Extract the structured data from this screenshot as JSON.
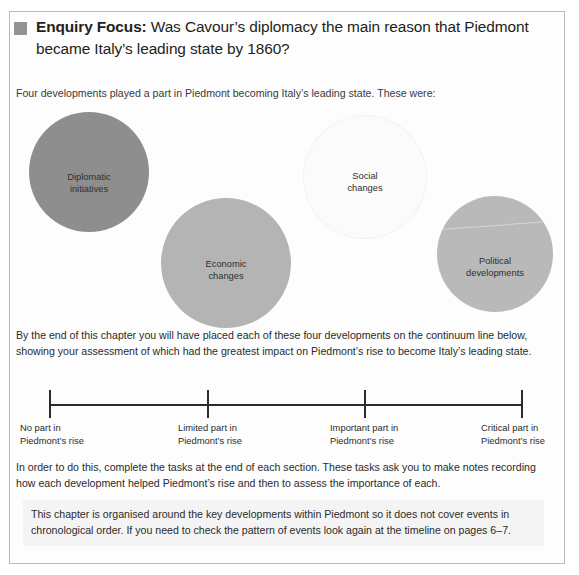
{
  "enquiry": {
    "bullet_icon": "square-bullet-icon",
    "label": "Enquiry Focus:",
    "question": " Was Cavour’s diplomacy the main reason that Piedmont became Italy’s leading state by 1860?"
  },
  "intro": "Four developments played a part in Piedmont becoming Italy’s leading state. These were:",
  "developments": [
    {
      "id": "diplomatic",
      "line1": "Diplomatic",
      "line2": "initiatives",
      "color": "#8e8e8e"
    },
    {
      "id": "economic",
      "line1": "Economic",
      "line2": "changes",
      "color": "#b4b4b4"
    },
    {
      "id": "social",
      "line1": "Social",
      "line2": "changes",
      "color": "#fbfbfb"
    },
    {
      "id": "political",
      "line1": "Political",
      "line2": "developments",
      "color": "#b9b9b9"
    }
  ],
  "continuum_intro": "By the end of this chapter you will have placed each of these four developments on the continuum line below, showing your assessment of which had the greatest impact on Piedmont’s rise to become Italy’s leading state.",
  "continuum": {
    "ticks": [
      {
        "line1": "No part in",
        "line2": "Piedmont’s rise"
      },
      {
        "line1": "Limited part in",
        "line2": "Piedmont’s rise"
      },
      {
        "line1": "Important part in",
        "line2": "Piedmont’s rise"
      },
      {
        "line1": "Critical part in",
        "line2": "Piedmont’s rise"
      }
    ]
  },
  "tasks_text": "In order to do this, complete the tasks at the end of each section. These tasks ask you to make notes recording how each development helped Piedmont’s rise and then to assess the importance of each.",
  "note_text": "This chapter is organised around the key developments within Piedmont so it does not cover events in chronological order. If you need to check the pattern of events look again at the timeline on pages 6–7."
}
